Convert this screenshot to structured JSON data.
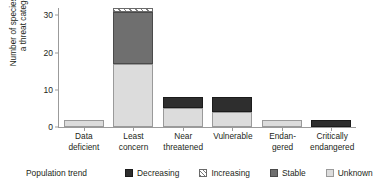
{
  "chart_data": {
    "type": "bar",
    "subtype": "stacked-bar",
    "title": "",
    "xlabel": "",
    "ylabel": "Number of species within a threat category",
    "ylabel_lines": [
      "Number of species within",
      "a threat category"
    ],
    "ylim": [
      0,
      32
    ],
    "yticks": [
      0,
      10,
      20,
      30
    ],
    "ytick_labels": [
      "0",
      "10",
      "20",
      "30"
    ],
    "grid": false,
    "legend_position": "bottom",
    "legend_title": "Population trend",
    "categories": [
      "Data deficient",
      "Least concern",
      "Near threatened",
      "Vulnerable",
      "Endangered",
      "Critically endangered"
    ],
    "category_label_lines": [
      [
        "Data",
        "deficient"
      ],
      [
        "Least",
        "concern"
      ],
      [
        "Near",
        "threatened"
      ],
      [
        "Vulnerable",
        ""
      ],
      [
        "Endan-",
        "gered"
      ],
      [
        "Critically",
        "endangered"
      ]
    ],
    "series": [
      {
        "name": "Decreasing",
        "key": "decreasing",
        "color": "#2e2e2e",
        "pattern": "solid",
        "values": [
          0,
          0,
          3,
          4,
          0,
          2
        ]
      },
      {
        "name": "Increasing",
        "key": "increasing",
        "color": "#ffffff",
        "pattern": "diagonal-hatch",
        "values": [
          0,
          1,
          0,
          0,
          0,
          0
        ]
      },
      {
        "name": "Stable",
        "key": "stable",
        "color": "#6f6f6f",
        "pattern": "solid",
        "values": [
          0,
          14,
          0,
          0,
          0,
          0
        ]
      },
      {
        "name": "Unknown",
        "key": "unknown",
        "color": "#dcdcdc",
        "pattern": "solid",
        "values": [
          2,
          17,
          5,
          4,
          2,
          0
        ]
      }
    ],
    "stack_order_bottom_to_top": [
      "unknown",
      "stable",
      "decreasing",
      "increasing"
    ],
    "totals": [
      2,
      32,
      8,
      8,
      2,
      2
    ]
  }
}
